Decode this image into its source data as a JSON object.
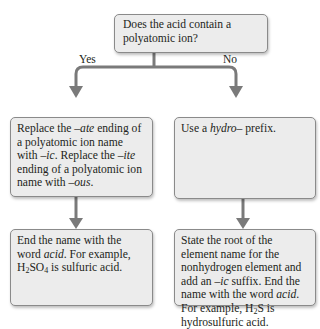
{
  "question": "Does the acid contain a polyatomic ion?",
  "branches": {
    "yes": {
      "label": "Yes",
      "step1": {
        "pre": "Replace the ",
        "it1": "–ate",
        "mid1": " ending of a polyatomic ion name with ",
        "it2": "–ic",
        "mid2": ". Replace the ",
        "it3": "–ite",
        "mid3": " ending of a polyatomic ion name with ",
        "it4": "–ous",
        "end": "."
      },
      "step2": {
        "pre": "End the name with the word ",
        "it": "acid",
        "mid": ". For example, ",
        "formula_h": "H",
        "formula_sub1": "2",
        "formula_so": "SO",
        "formula_sub2": "4",
        "end": " is sulfuric acid."
      }
    },
    "no": {
      "label": "No",
      "step1": {
        "pre": "Use a ",
        "it": "hydro",
        "end": "– prefix."
      },
      "step2": {
        "pre": "State the root of the element name for the nonhydrogen element and add an ",
        "it1": "–ic",
        "mid": " suffix. End the name with the word ",
        "it2": "acid",
        "mid2": ". For example, ",
        "formula_h": "H",
        "formula_sub": "2",
        "formula_s": "S",
        "end": " is hydrosulfuric acid."
      }
    }
  },
  "colors": {
    "box_fill": "#ececec",
    "box_border": "#8a8a8a",
    "arrow": "#7a7a7a"
  }
}
